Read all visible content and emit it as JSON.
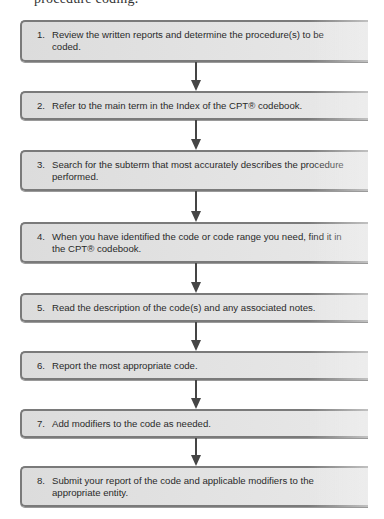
{
  "header": {
    "cutoff_text": "procedure coding."
  },
  "flowchart": {
    "steps": [
      {
        "number": "1.",
        "text": "Review the written reports and determine the procedure(s) to be coded."
      },
      {
        "number": "2.",
        "text": "Refer to the main term in the Index of the CPT® codebook."
      },
      {
        "number": "3.",
        "text": "Search for the subterm that most accurately describes the procedure performed."
      },
      {
        "number": "4.",
        "text": "When you have identified the code or code range you need, find it in the CPT® codebook."
      },
      {
        "number": "5.",
        "text": "Read the description of the code(s) and any associated notes."
      },
      {
        "number": "6.",
        "text": "Report the most appropriate code."
      },
      {
        "number": "7.",
        "text": "Add modifiers to the code as needed."
      },
      {
        "number": "8.",
        "text": "Submit your report of the code and applicable modifiers to the appropriate entity."
      }
    ],
    "colors": {
      "box_fill": "#e3e3e3",
      "box_border": "#7a7a7a",
      "arrow": "#454545",
      "text": "#2a2a2a"
    }
  }
}
